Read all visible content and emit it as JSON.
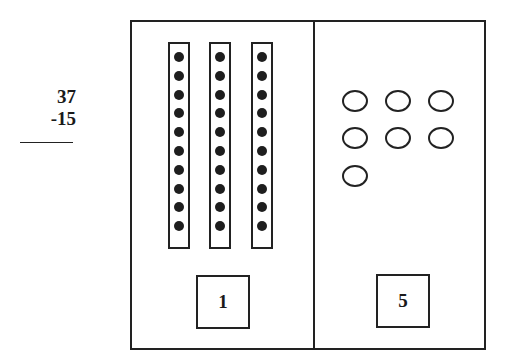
{
  "problem": {
    "minuend": "37",
    "subtrahend": "-15"
  },
  "place_value_mat": {
    "tens": {
      "rods": 3,
      "dots_per_rod": 10,
      "digit_label": "1"
    },
    "ones": {
      "units": 7,
      "digit_label": "5"
    }
  },
  "colors": {
    "stroke": "#222222",
    "dot": "#1e1e1e",
    "background": "#ffffff"
  }
}
